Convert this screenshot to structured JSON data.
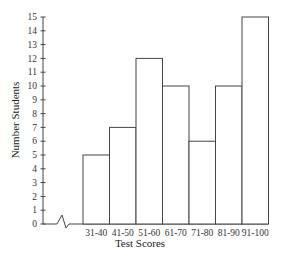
{
  "chart_data": {
    "type": "bar",
    "title": "",
    "xlabel": "Test Scores",
    "ylabel": "Number Students",
    "categories": [
      "31-40",
      "41-50",
      "51-60",
      "61-70",
      "71-80",
      "81-90",
      "91-100"
    ],
    "values": [
      5,
      7,
      12,
      10,
      6,
      10,
      15
    ],
    "ylim": [
      0,
      15
    ],
    "yticks": [
      0,
      1,
      2,
      3,
      4,
      5,
      6,
      7,
      8,
      9,
      10,
      11,
      12,
      13,
      14,
      15
    ],
    "grid": false,
    "legend": null,
    "axis_break": "x-axis break symbol between origin and first bin",
    "bar_fill": "#ffffff",
    "bar_stroke": "#444444"
  }
}
